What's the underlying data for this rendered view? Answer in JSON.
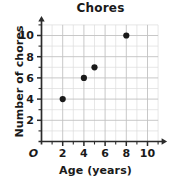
{
  "chart_data": {
    "type": "scatter",
    "title": "Chores",
    "xlabel": "Age (years)",
    "ylabel": "Number of chores",
    "origin_label": "O",
    "xlim": [
      0,
      11
    ],
    "ylim": [
      0,
      11
    ],
    "grid": true,
    "legend": null,
    "x_ticks_major": [
      2,
      4,
      6,
      8,
      10
    ],
    "x_ticks_minor": [
      1,
      3,
      5,
      7,
      9,
      11
    ],
    "y_ticks_major": [
      2,
      4,
      6,
      8,
      10
    ],
    "y_ticks_minor": [
      1,
      3,
      5,
      7,
      9,
      11
    ],
    "x_tick_labels": [
      "2",
      "4",
      "6",
      "8",
      "10"
    ],
    "y_tick_labels": [
      "2",
      "4",
      "6",
      "8",
      "10"
    ],
    "points": [
      {
        "x": 2,
        "y": 4
      },
      {
        "x": 4,
        "y": 6
      },
      {
        "x": 5,
        "y": 7
      },
      {
        "x": 8,
        "y": 10
      }
    ],
    "marker_color": "#1a1a1a",
    "marker_radius": 3.1,
    "grid_color_minor": "#dcdcdc",
    "grid_color_major": "#c2c2c2",
    "axis_color": "#2b2b2b"
  }
}
